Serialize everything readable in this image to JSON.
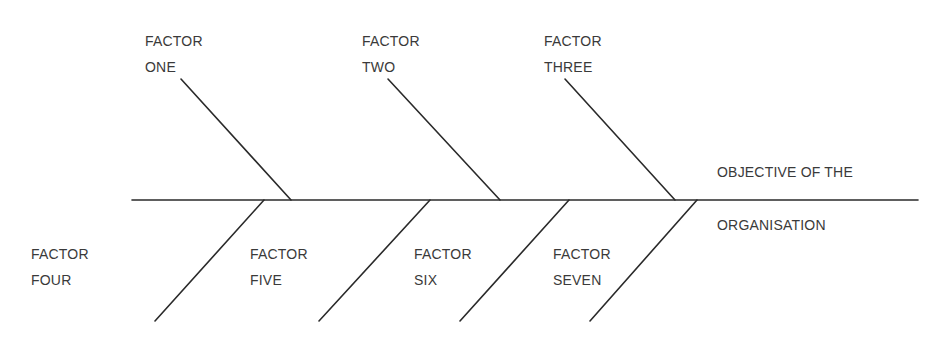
{
  "diagram": {
    "type": "fishbone",
    "colors": {
      "line": "#2a2a2a",
      "text": "#3a3a3a",
      "background": "#ffffff"
    },
    "objective": {
      "line1": "OBJECTIVE OF THE",
      "line2": "ORGANISATION"
    },
    "factors": [
      {
        "id": "one",
        "line1": "FACTOR",
        "line2": "ONE",
        "side": "top"
      },
      {
        "id": "two",
        "line1": "FACTOR",
        "line2": "TWO",
        "side": "top"
      },
      {
        "id": "three",
        "line1": "FACTOR",
        "line2": "THREE",
        "side": "top"
      },
      {
        "id": "four",
        "line1": "FACTOR",
        "line2": "FOUR",
        "side": "bottom"
      },
      {
        "id": "five",
        "line1": "FACTOR",
        "line2": "FIVE",
        "side": "bottom"
      },
      {
        "id": "six",
        "line1": "FACTOR",
        "line2": "SIX",
        "side": "bottom"
      },
      {
        "id": "seven",
        "line1": "FACTOR",
        "line2": "SEVEN",
        "side": "bottom"
      }
    ]
  }
}
